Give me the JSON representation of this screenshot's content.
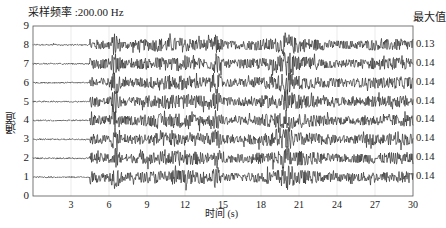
{
  "chart_data": {
    "type": "line",
    "title": "采样频率 :200.00 Hz",
    "xlabel": "时间 (s)",
    "ylabel": "通道",
    "right_header": "最大值",
    "xlim": [
      0,
      30
    ],
    "ylim": [
      0,
      9
    ],
    "x_ticks": [
      3,
      6,
      9,
      12,
      15,
      18,
      21,
      24,
      27,
      30
    ],
    "y_ticks": [
      0,
      1,
      2,
      3,
      4,
      5,
      6,
      7,
      8,
      9
    ],
    "grid": true,
    "sampling_rate_hz": 200.0,
    "series": [
      {
        "name": "通道 8",
        "offset": 8,
        "max": "0.13"
      },
      {
        "name": "通道 7",
        "offset": 7,
        "max": "0.14"
      },
      {
        "name": "通道 6",
        "offset": 6,
        "max": "0.14"
      },
      {
        "name": "通道 5",
        "offset": 5,
        "max": "0.14"
      },
      {
        "name": "通道 4",
        "offset": 4,
        "max": "0.14"
      },
      {
        "name": "通道 3",
        "offset": 3,
        "max": "0.14"
      },
      {
        "name": "通道 2",
        "offset": 2,
        "max": "0.14"
      },
      {
        "name": "通道 1",
        "offset": 1,
        "max": "0.14"
      }
    ],
    "signal_description": "Seismic-like waveforms; quiet before ~4.5 s, strong oscillation from ~5 s to ~30 s with peak spikes near 6.5 s, 14.5 s and 20 s"
  },
  "labels": {
    "title": "采样频率 :200.00 Hz",
    "right_header": "最大值",
    "xlabel": "时间 (s)",
    "ylabel": "通道"
  },
  "colors": {
    "trace": "#333333",
    "axis": "#555555",
    "grid": "#dddddd"
  }
}
